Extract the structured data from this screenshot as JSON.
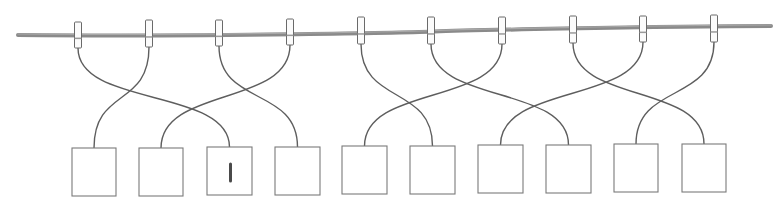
{
  "scene": {
    "title": "Clothesline matching puzzle",
    "colors": {
      "rope": "#8a8a8a",
      "string": "#5e5e5e",
      "clip": "#fbfbfb",
      "box_border": "#7a7a7a",
      "mark": "#4a4a4a"
    },
    "rope": {
      "start": [
        18,
        35
      ],
      "end": [
        771,
        26
      ]
    },
    "clips": [
      {
        "id": 1,
        "x": 78,
        "top": 22,
        "bottom": 48
      },
      {
        "id": 2,
        "x": 149,
        "top": 20,
        "bottom": 47
      },
      {
        "id": 3,
        "x": 219,
        "top": 20,
        "bottom": 46
      },
      {
        "id": 4,
        "x": 290,
        "top": 19,
        "bottom": 45
      },
      {
        "id": 5,
        "x": 361,
        "top": 17,
        "bottom": 44
      },
      {
        "id": 6,
        "x": 431,
        "top": 17,
        "bottom": 44
      },
      {
        "id": 7,
        "x": 502,
        "top": 17,
        "bottom": 44
      },
      {
        "id": 8,
        "x": 573,
        "top": 16,
        "bottom": 43
      },
      {
        "id": 9,
        "x": 643,
        "top": 16,
        "bottom": 42
      },
      {
        "id": 10,
        "x": 714,
        "top": 15,
        "bottom": 42
      }
    ],
    "boxes": [
      {
        "id": 1,
        "x": 72,
        "y": 148,
        "w": 44,
        "h": 48,
        "label": ""
      },
      {
        "id": 2,
        "x": 139,
        "y": 148,
        "w": 44,
        "h": 48,
        "label": ""
      },
      {
        "id": 3,
        "x": 207,
        "y": 147,
        "w": 45,
        "h": 48,
        "label": "I"
      },
      {
        "id": 4,
        "x": 275,
        "y": 147,
        "w": 45,
        "h": 48,
        "label": ""
      },
      {
        "id": 5,
        "x": 342,
        "y": 146,
        "w": 45,
        "h": 48,
        "label": ""
      },
      {
        "id": 6,
        "x": 410,
        "y": 146,
        "w": 45,
        "h": 48,
        "label": ""
      },
      {
        "id": 7,
        "x": 478,
        "y": 145,
        "w": 45,
        "h": 48,
        "label": ""
      },
      {
        "id": 8,
        "x": 546,
        "y": 145,
        "w": 45,
        "h": 48,
        "label": ""
      },
      {
        "id": 9,
        "x": 614,
        "y": 144,
        "w": 44,
        "h": 48,
        "label": ""
      },
      {
        "id": 10,
        "x": 682,
        "y": 144,
        "w": 44,
        "h": 48,
        "label": ""
      }
    ],
    "connections": [
      {
        "clip": 1,
        "box": 3
      },
      {
        "clip": 2,
        "box": 1
      },
      {
        "clip": 3,
        "box": 4
      },
      {
        "clip": 4,
        "box": 2
      },
      {
        "clip": 5,
        "box": 6
      },
      {
        "clip": 6,
        "box": 8
      },
      {
        "clip": 7,
        "box": 5
      },
      {
        "clip": 8,
        "box": 10
      },
      {
        "clip": 9,
        "box": 7
      },
      {
        "clip": 10,
        "box": 9
      }
    ],
    "filled_box_mark": "I"
  }
}
